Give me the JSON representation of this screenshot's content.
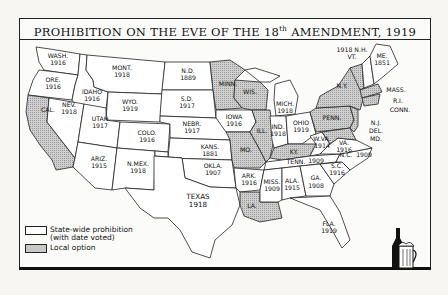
{
  "title": {
    "main": "PROHIBITION ON THE EVE OF THE 18",
    "superscript": "th",
    "rest": " AMENDMENT, 1919"
  },
  "legend": {
    "items": [
      {
        "type": "state-wide",
        "label_line1": "State-wide prohibition",
        "label_line2": "(with date voted)",
        "color": "#ffffff"
      },
      {
        "type": "local-option",
        "label_line1": "Local option",
        "color": "#c8c8c8"
      }
    ]
  },
  "colors": {
    "state_wide": "#ffffff",
    "local_option": "#c4c4c4",
    "border": "#222222"
  },
  "states": [
    {
      "abbr": "WASH.",
      "year": "1916",
      "status": "state-wide"
    },
    {
      "abbr": "ORE.",
      "year": "1916",
      "status": "state-wide"
    },
    {
      "abbr": "CAL.",
      "year": "",
      "status": "local-option"
    },
    {
      "abbr": "IDAHO",
      "year": "1916",
      "status": "state-wide"
    },
    {
      "abbr": "NEV.",
      "year": "1918",
      "status": "state-wide"
    },
    {
      "abbr": "MONT.",
      "year": "1918",
      "status": "state-wide"
    },
    {
      "abbr": "WYO.",
      "year": "1919",
      "status": "state-wide"
    },
    {
      "abbr": "UTAH",
      "year": "1917",
      "status": "state-wide"
    },
    {
      "abbr": "COLO.",
      "year": "1916",
      "status": "state-wide"
    },
    {
      "abbr": "ARIZ.",
      "year": "1915",
      "status": "state-wide"
    },
    {
      "abbr": "N.MEX.",
      "year": "1918",
      "status": "state-wide"
    },
    {
      "abbr": "N.D.",
      "year": "1889",
      "status": "state-wide"
    },
    {
      "abbr": "S.D.",
      "year": "1917",
      "status": "state-wide"
    },
    {
      "abbr": "NEBR.",
      "year": "1917",
      "status": "state-wide"
    },
    {
      "abbr": "KANS.",
      "year": "1881",
      "status": "state-wide"
    },
    {
      "abbr": "OKLA.",
      "year": "1907",
      "status": "state-wide"
    },
    {
      "abbr": "TEXAS",
      "year": "1918",
      "status": "state-wide"
    },
    {
      "abbr": "MINN.",
      "year": "",
      "status": "local-option"
    },
    {
      "abbr": "IOWA",
      "year": "1916",
      "status": "state-wide"
    },
    {
      "abbr": "MO.",
      "year": "",
      "status": "local-option"
    },
    {
      "abbr": "ARK.",
      "year": "1916",
      "status": "state-wide"
    },
    {
      "abbr": "LA.",
      "year": "",
      "status": "local-option"
    },
    {
      "abbr": "WIS.",
      "year": "",
      "status": "local-option"
    },
    {
      "abbr": "ILL.",
      "year": "",
      "status": "local-option"
    },
    {
      "abbr": "MICH.",
      "year": "1918",
      "status": "state-wide"
    },
    {
      "abbr": "IND.",
      "year": "1918",
      "status": "state-wide"
    },
    {
      "abbr": "OHIO",
      "year": "1919",
      "status": "state-wide"
    },
    {
      "abbr": "KY.",
      "year": "",
      "status": "local-option"
    },
    {
      "abbr": "TENN.",
      "year": "1909",
      "status": "state-wide"
    },
    {
      "abbr": "MISS.",
      "year": "1909",
      "status": "state-wide"
    },
    {
      "abbr": "ALA.",
      "year": "1915",
      "status": "state-wide"
    },
    {
      "abbr": "GA.",
      "year": "1908",
      "status": "state-wide"
    },
    {
      "abbr": "FLA.",
      "year": "1919",
      "status": "state-wide"
    },
    {
      "abbr": "S.C.",
      "year": "1916",
      "status": "state-wide"
    },
    {
      "abbr": "N.C.",
      "year": "1909",
      "status": "state-wide"
    },
    {
      "abbr": "VA.",
      "year": "1916",
      "status": "state-wide"
    },
    {
      "abbr": "W.VA.",
      "year": "1914",
      "status": "state-wide"
    },
    {
      "abbr": "PENN.",
      "year": "",
      "status": "local-option"
    },
    {
      "abbr": "N.Y.",
      "year": "",
      "status": "local-option"
    },
    {
      "abbr": "VT.",
      "year": "",
      "status": "local-option"
    },
    {
      "abbr": "N.H.",
      "year": "1918",
      "status": "state-wide"
    },
    {
      "abbr": "ME.",
      "year": "1851",
      "status": "state-wide"
    },
    {
      "abbr": "MASS.",
      "year": "",
      "status": "local-option"
    },
    {
      "abbr": "R.I.",
      "year": "",
      "status": "local-option"
    },
    {
      "abbr": "CONN.",
      "year": "",
      "status": "local-option"
    },
    {
      "abbr": "N.J.",
      "year": "",
      "status": "local-option"
    },
    {
      "abbr": "DEL.",
      "year": "",
      "status": "local-option"
    },
    {
      "abbr": "MD.",
      "year": "",
      "status": "local-option"
    }
  ],
  "labels": {
    "nh_vt": "1918 N.H.",
    "vt": "VT.",
    "illustration": "bottle-and-beer-mug"
  }
}
